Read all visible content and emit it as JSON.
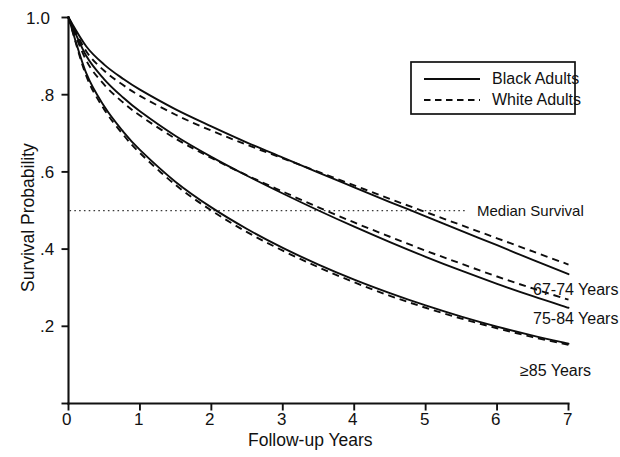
{
  "figure": {
    "name": "survival-probability-curves"
  },
  "axes": {
    "x": {
      "title": "Follow-up Years",
      "ticks": [
        "0",
        "1",
        "2",
        "3",
        "4",
        "5",
        "6",
        "7"
      ],
      "min": 0,
      "max": 7
    },
    "y": {
      "title": "Survival Probability",
      "ticks": [
        "0",
        ".2",
        ".4",
        ".6",
        ".8",
        "1.0"
      ],
      "min": 0,
      "max": 1.0
    }
  },
  "legend": {
    "entries": [
      {
        "label": "Black Adults",
        "style": "solid"
      },
      {
        "label": "White Adults",
        "style": "dashed"
      }
    ]
  },
  "annotations": {
    "median_survival": "Median Survival",
    "median_value": 0.5,
    "series_labels": [
      "67-74 Years",
      "75-84 Years",
      "≥85 Years"
    ]
  },
  "chart_data": {
    "type": "line",
    "title": "",
    "subtitle": "",
    "xlabel": "Follow-up Years",
    "ylabel": "Survival Probability",
    "xlim": [
      0,
      7
    ],
    "ylim": [
      0,
      1.0
    ],
    "xticks": [
      0,
      1,
      2,
      3,
      4,
      5,
      6,
      7
    ],
    "yticks": [
      0,
      0.2,
      0.4,
      0.6,
      0.8,
      1.0
    ],
    "grid": false,
    "legend_position": "upper-right",
    "annotation_lines": [
      {
        "name": "Median Survival",
        "orientation": "horizontal",
        "y": 0.5,
        "style": "dotted"
      }
    ],
    "x": [
      0,
      0.25,
      0.5,
      0.75,
      1,
      1.5,
      2,
      2.5,
      3,
      3.5,
      4,
      4.5,
      5,
      5.5,
      6,
      6.5,
      7
    ],
    "series": [
      {
        "name": "Black Adults 67-74 Years",
        "group": "Black Adults",
        "age_group": "67-74 Years",
        "style": "solid",
        "values": [
          1.0,
          0.925,
          0.878,
          0.843,
          0.813,
          0.762,
          0.718,
          0.676,
          0.637,
          0.598,
          0.56,
          0.522,
          0.485,
          0.447,
          0.41,
          0.372,
          0.335
        ]
      },
      {
        "name": "White Adults 67-74 Years",
        "group": "White Adults",
        "age_group": "67-74 Years",
        "style": "dashed",
        "values": [
          1.0,
          0.912,
          0.862,
          0.827,
          0.797,
          0.748,
          0.707,
          0.67,
          0.635,
          0.6,
          0.565,
          0.53,
          0.496,
          0.462,
          0.428,
          0.394,
          0.36
        ]
      },
      {
        "name": "Black Adults 75-84 Years",
        "group": "Black Adults",
        "age_group": "75-84 Years",
        "style": "solid",
        "values": [
          1.0,
          0.9,
          0.84,
          0.795,
          0.757,
          0.693,
          0.639,
          0.59,
          0.544,
          0.5,
          0.458,
          0.418,
          0.38,
          0.344,
          0.31,
          0.278,
          0.248
        ]
      },
      {
        "name": "White Adults 75-84 Years",
        "group": "White Adults",
        "age_group": "75-84 Years",
        "style": "dashed",
        "values": [
          1.0,
          0.888,
          0.826,
          0.782,
          0.746,
          0.686,
          0.636,
          0.591,
          0.549,
          0.508,
          0.469,
          0.432,
          0.396,
          0.362,
          0.329,
          0.298,
          0.269
        ]
      },
      {
        "name": "Black Adults 85+ Years",
        "group": "Black Adults",
        "age_group": "≥85 Years",
        "style": "solid",
        "values": [
          1.0,
          0.855,
          0.77,
          0.708,
          0.657,
          0.574,
          0.508,
          0.452,
          0.403,
          0.36,
          0.321,
          0.286,
          0.254,
          0.225,
          0.199,
          0.176,
          0.155
        ]
      },
      {
        "name": "White Adults 85+ Years",
        "group": "White Adults",
        "age_group": "≥85 Years",
        "style": "dashed",
        "values": [
          1.0,
          0.848,
          0.762,
          0.7,
          0.649,
          0.566,
          0.5,
          0.444,
          0.396,
          0.353,
          0.314,
          0.279,
          0.248,
          0.22,
          0.195,
          0.172,
          0.152
        ]
      }
    ],
    "median_survival_crossings": {
      "67-74 Years": 4.55,
      "75-84 Years": 3.5,
      "85+ Years": 2.1
    }
  }
}
